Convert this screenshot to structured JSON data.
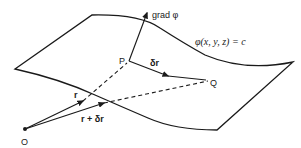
{
  "diagram": {
    "surface_label": "φ(x, y, z) = c",
    "points": {
      "origin": "O",
      "p": "P",
      "q": "Q"
    },
    "vectors": {
      "gradient": "grad φ",
      "displacement": "δr",
      "position_p": "r",
      "position_q": "r + δr"
    },
    "colors": {
      "ink": "#1a1a1a",
      "background": "#ffffff"
    }
  }
}
